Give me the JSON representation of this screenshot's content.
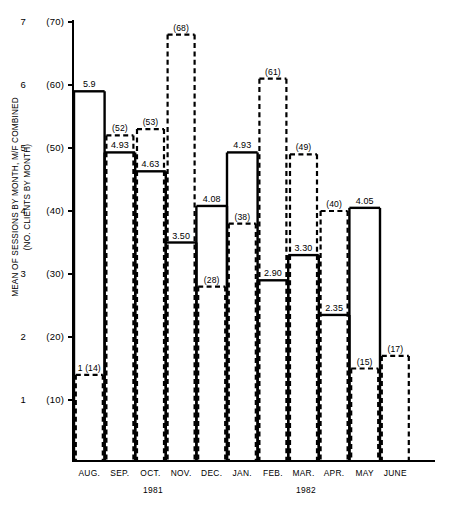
{
  "axis": {
    "ylabel_line1": "MEAN OF SESSIONS BY MONTH, M/F COMBINED",
    "ylabel_line2": "(NO. CLIENTS BY MONTH)",
    "year_left": "1981",
    "year_right": "1982"
  },
  "chart_data": {
    "type": "bar",
    "title": "",
    "xlabel": "",
    "ylabel": "MEAN OF SESSIONS BY MONTH, M/F COMBINED (NO. CLIENTS BY MONTH)",
    "categories": [
      "AUG.",
      "SEP.",
      "OCT.",
      "NOV.",
      "DEC.",
      "JAN.",
      "FEB.",
      "MAR.",
      "APR.",
      "MAY",
      "JUNE"
    ],
    "year_groups": [
      {
        "label": "1981",
        "months": [
          "AUG.",
          "SEP.",
          "OCT.",
          "NOV.",
          "DEC."
        ]
      },
      {
        "label": "1982",
        "months": [
          "JAN.",
          "FEB.",
          "MAR.",
          "APR.",
          "MAY",
          "JUNE"
        ]
      }
    ],
    "grid": false,
    "legend": "none",
    "ylim": [
      0,
      7
    ],
    "ylim_secondary": [
      0,
      70
    ],
    "yticks": [
      1,
      2,
      3,
      4,
      5,
      6,
      7
    ],
    "yticklabels": [
      "1",
      "2",
      "3",
      "4",
      "5",
      "6",
      "7"
    ],
    "yticklabels_secondary": [
      "(10)",
      "(20)",
      "(30)",
      "(40)",
      "(50)",
      "(60)",
      "(70)"
    ],
    "series": [
      {
        "name": "Mean of sessions by month, M/F combined",
        "style": "solid",
        "axis": "left",
        "values": [
          5.9,
          4.93,
          4.63,
          3.5,
          4.08,
          4.93,
          2.9,
          3.3,
          2.35,
          4.05,
          null
        ],
        "labels": [
          "5.9",
          "4.93",
          "4.63",
          "3.50",
          "4.08",
          "4.93",
          "2.90",
          "3.30",
          "2.35",
          "4.05",
          ""
        ]
      },
      {
        "name": "No. clients by month",
        "style": "dashed",
        "axis": "right",
        "values": [
          14,
          52,
          53,
          68,
          28,
          38,
          61,
          49,
          40,
          15,
          17
        ],
        "labels": [
          "1 (14)",
          "(52)",
          "(53)",
          "(68)",
          "(28)",
          "(38)",
          "(61)",
          "(49)",
          "(40)",
          "(15)",
          "(17)"
        ]
      }
    ]
  },
  "caption": ""
}
